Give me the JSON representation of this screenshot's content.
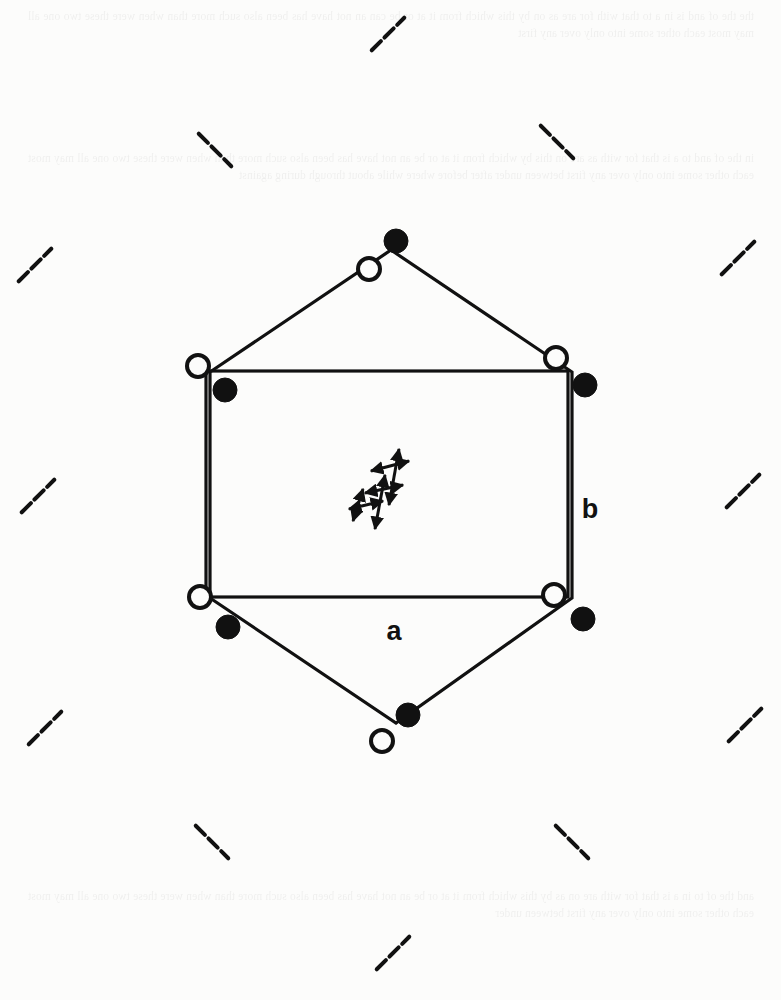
{
  "page": {
    "width": 781,
    "height": 1000,
    "background_color": "#fcfcfb",
    "ink_color": "#111111"
  },
  "ghost_text": {
    "note": "Faint show-through text from the reverse side of the page; illegible in the scan.",
    "top": "the the of and is in a to that with for are as on by this which from it at or be can an not have has been also such more than when were these two one all may most each other some into only over any first",
    "middle": "in the of and to a is that for with as are on this by which from it at or be an not have has been also such more than when were these two one all may most each other some into only over any first between under after before where while about through during against",
    "bottom": "and the of to in a is that for with are on as by this which from it at or be an not have has been also such more than when were these two one all may most each other some into only over any first between under"
  },
  "figure": {
    "label_a": "a",
    "label_b": "b",
    "label_a_position": {
      "x": 394,
      "y": 640
    },
    "label_b_position": {
      "x": 590,
      "y": 518
    },
    "unit_cell": {
      "type": "rectangle",
      "x": 206,
      "y": 371,
      "width": 362,
      "height": 226,
      "stroke_width": 3.2,
      "corners": [
        {
          "name": "top-left",
          "x": 206,
          "y": 371
        },
        {
          "name": "top-right",
          "x": 568,
          "y": 371
        },
        {
          "name": "bottom-right",
          "x": 568,
          "y": 597
        },
        {
          "name": "bottom-left",
          "x": 206,
          "y": 597
        }
      ]
    },
    "hexagon": {
      "type": "hexagon-outline",
      "stroke_width": 3.2,
      "vertices": [
        {
          "name": "top-apex",
          "x": 391,
          "y": 250
        },
        {
          "name": "upper-right",
          "x": 572,
          "y": 372
        },
        {
          "name": "lower-right",
          "x": 572,
          "y": 598
        },
        {
          "name": "bottom-apex",
          "x": 396,
          "y": 723
        },
        {
          "name": "lower-left",
          "x": 210,
          "y": 598
        },
        {
          "name": "upper-left",
          "x": 210,
          "y": 372
        }
      ]
    },
    "atoms": {
      "legend": {
        "open_circle": "open-circle-atom",
        "filled_circle": "filled-circle-atom"
      },
      "open_radius": 11,
      "filled_radius": 12,
      "sites": [
        {
          "id": 1,
          "site": "top-apex",
          "open": {
            "x": 369,
            "y": 269
          },
          "filled": {
            "x": 396,
            "y": 241
          }
        },
        {
          "id": 2,
          "site": "top-left",
          "open": {
            "x": 198,
            "y": 366
          },
          "filled": {
            "x": 225,
            "y": 390
          }
        },
        {
          "id": 3,
          "site": "top-right",
          "open": {
            "x": 556,
            "y": 358
          },
          "filled": {
            "x": 585,
            "y": 385
          }
        },
        {
          "id": 4,
          "site": "bottom-left",
          "open": {
            "x": 200,
            "y": 597
          },
          "filled": {
            "x": 228,
            "y": 627
          }
        },
        {
          "id": 5,
          "site": "bottom-right",
          "open": {
            "x": 554,
            "y": 595
          },
          "filled": {
            "x": 583,
            "y": 619
          }
        },
        {
          "id": 6,
          "site": "bottom-apex",
          "open": {
            "x": 382,
            "y": 741
          },
          "filled": {
            "x": 408,
            "y": 715
          }
        }
      ]
    },
    "central_motif": {
      "name": "double-headed-arrow-cluster",
      "center": {
        "x": 387,
        "y": 487
      },
      "description": "Small cluster of bold double-headed arrows forming a tilted parallelogram, indicating displacement or polarization directions.",
      "arrow_count": 6
    },
    "dash_marks": {
      "name": "dashed-tick-lattice",
      "description": "Short dashed tick segments scattered in a superlattice pattern across the page.",
      "segment_length": 46,
      "stroke_width": 4,
      "marks": [
        {
          "x": 388,
          "y": 34,
          "orientation": "forward-slash"
        },
        {
          "x": 215,
          "y": 150,
          "orientation": "backslash"
        },
        {
          "x": 557,
          "y": 142,
          "orientation": "backslash"
        },
        {
          "x": 35,
          "y": 265,
          "orientation": "forward-slash"
        },
        {
          "x": 738,
          "y": 258,
          "orientation": "forward-slash"
        },
        {
          "x": 38,
          "y": 496,
          "orientation": "forward-slash"
        },
        {
          "x": 743,
          "y": 491,
          "orientation": "forward-slash"
        },
        {
          "x": 45,
          "y": 728,
          "orientation": "forward-slash"
        },
        {
          "x": 745,
          "y": 725,
          "orientation": "forward-slash"
        },
        {
          "x": 212,
          "y": 842,
          "orientation": "backslash"
        },
        {
          "x": 572,
          "y": 842,
          "orientation": "backslash"
        },
        {
          "x": 393,
          "y": 953,
          "orientation": "forward-slash"
        }
      ]
    }
  }
}
